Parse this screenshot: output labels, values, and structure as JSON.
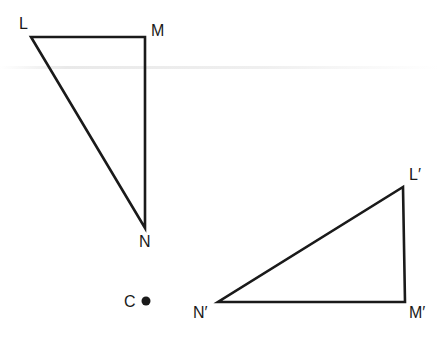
{
  "figure": {
    "colors": {
      "stroke": "#1a1a1a",
      "background": "#ffffff"
    },
    "original_triangle": {
      "name": "LMN",
      "vertices": {
        "L": {
          "label": "L",
          "x": 31,
          "y": 37
        },
        "M": {
          "label": "M",
          "x": 145,
          "y": 37
        },
        "N": {
          "label": "N",
          "x": 145,
          "y": 228
        }
      }
    },
    "image_triangle": {
      "name": "L'M'N'",
      "vertices": {
        "L_prime": {
          "label": "L′",
          "x": 403,
          "y": 187
        },
        "M_prime": {
          "label": "M′",
          "x": 405,
          "y": 302
        },
        "N_prime": {
          "label": "N′",
          "x": 218,
          "y": 302
        }
      }
    },
    "center": {
      "label": "C",
      "x": 146,
      "y": 301
    }
  }
}
